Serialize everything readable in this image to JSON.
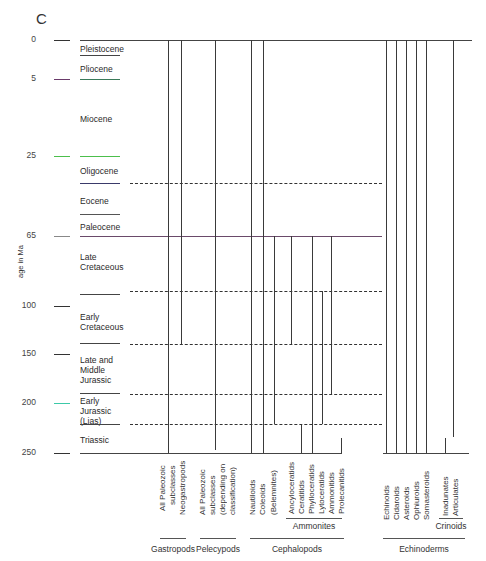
{
  "figure": {
    "panel_letter": "C",
    "y_axis_title": "age in Ma",
    "colors": {
      "line": "#3a3a3a",
      "green_marker": "#4cbf4c",
      "purple_marker": "#6a3a6a",
      "teal_marker": "#3cc9a8"
    }
  },
  "age_ticks": [
    {
      "label": "0",
      "y": 40
    },
    {
      "label": "5",
      "y": 79
    },
    {
      "label": "25",
      "y": 156
    },
    {
      "label": "65",
      "y": 236
    },
    {
      "label": "100",
      "y": 306
    },
    {
      "label": "150",
      "y": 354
    },
    {
      "label": "200",
      "y": 403
    },
    {
      "label": "250",
      "y": 453
    }
  ],
  "periods": [
    {
      "label": "Pleistocene",
      "y": 44
    },
    {
      "label": "Pliocene",
      "y": 64
    },
    {
      "label": "Miocene",
      "y": 114
    },
    {
      "label": "Oligocene",
      "y": 166
    },
    {
      "label": "Eocene",
      "y": 196
    },
    {
      "label": "Paleocene",
      "y": 222
    },
    {
      "label": "Late Cretaceous",
      "y": 252
    },
    {
      "label": "Early Cretaceous",
      "y": 312
    },
    {
      "label": "Late and Middle Jurassic",
      "y": 355
    },
    {
      "label": "Early Jurassic (Lias)",
      "y": 396
    },
    {
      "label": "Triassic",
      "y": 435
    }
  ],
  "taxa": [
    {
      "label": "All Paleozoic subclasses",
      "group": "Gastropods"
    },
    {
      "label": "Neogastropods",
      "group": "Gastropods"
    },
    {
      "label": "All Paleozoic subclasses (depending on classification)",
      "group": "Pelecypods"
    },
    {
      "label": "Nautiloids",
      "group": "Cephalopods"
    },
    {
      "label": "Coleoids",
      "group": "Cephalopods"
    },
    {
      "label": "(Belemnites)",
      "group": "Cephalopods"
    },
    {
      "label": "Ancyloceratids",
      "group": "Ammonites"
    },
    {
      "label": "Ceratitids",
      "group": "Ammonites"
    },
    {
      "label": "Phylloceratids",
      "group": "Ammonites"
    },
    {
      "label": "Lytoceratids",
      "group": "Ammonites"
    },
    {
      "label": "Ammonitids",
      "group": "Ammonites"
    },
    {
      "label": "Prolecanitids",
      "group": "Ammonites"
    },
    {
      "label": "Echinoids",
      "group": "Echinoderms"
    },
    {
      "label": "Cidaroids",
      "group": "Echinoderms"
    },
    {
      "label": "Asteroids",
      "group": "Echinoderms"
    },
    {
      "label": "Ophiuroids",
      "group": "Echinoderms"
    },
    {
      "label": "Somasteroids",
      "group": "Echinoderms"
    },
    {
      "label": "Inadunates",
      "group": "Crinoids"
    },
    {
      "label": "Articulates",
      "group": "Crinoids"
    }
  ],
  "taxon_labels": {
    "gastro_all_1": "All Paleozoic",
    "gastro_all_2": "subclasses",
    "neogastropods": "Neogastropods",
    "pelecy_1": "All Paleozoic",
    "pelecy_2": "subclasses",
    "pelecy_3": "(depending on",
    "pelecy_4": "classification)",
    "nautiloids": "Nautiloids",
    "coleoids": "Coleoids",
    "belemnites": "(Belemnites)",
    "ancyloceratids": "Ancyloceratids",
    "ceratitids": "Ceratitids",
    "phylloceratids": "Phylloceratids",
    "lytoceratids": "Lytoceratids",
    "ammonitids": "Ammonitids",
    "prolecanitids": "Prolecanitids",
    "echinoids": "Echinoids",
    "cidaroids": "Cidaroids",
    "asteroids": "Asteroids",
    "ophiuroids": "Ophiuroids",
    "somasteroids": "Somasteroids",
    "inadunates": "Inadunates",
    "articulates": "Articulates"
  },
  "groups": {
    "gastropods": "Gastropods",
    "pelecypods": "Pelecypods",
    "cephalopods": "Cephalopods",
    "ammonites": "Ammonites",
    "echinoderms": "Echinoderms",
    "crinoids": "Crinoids"
  }
}
